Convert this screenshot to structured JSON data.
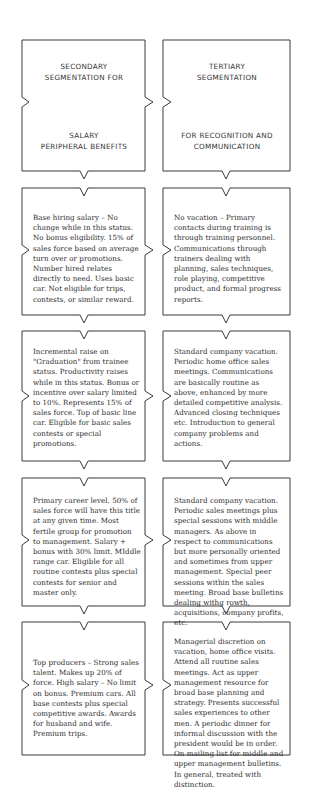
{
  "diagram": {
    "columns": [
      {
        "header": {
          "line1": "SECONDARY",
          "line2": "SEGMENTATION FOR",
          "line3": "SALARY",
          "line4": "PERIPHERAL BENEFITS"
        },
        "boxes": [
          "Base hiring salary – No change while in this status. No bonus eligibility. 15% of sales force based on average turn over or promotions. Number hired relates directly to need. Uses basic car. Not eligible for trips, contests, or similar reward.",
          "Incremental raise on \"Graduation\" from trainee status. Productivity raises while in this status. Bonus or incentive over salary limited to 10%. Represents 15% of sales force. Top of basic line car. Eligible for basic sales contests or special promotions.",
          "Primary career level. 50% of sales force will have this title at any given time. Most fertile group for promotion to management. Salary + bonus with 30% limit. MIddle range car. Eligible for all routine contests plus special contests for senior and master only.",
          "Top producers – Strong sales talent. Makes up 20% of force. High salary – No limit on bonus. Premium cars. All base contests plus special competitive awards. Awards for husband and wife. Premium trips."
        ]
      },
      {
        "header": {
          "line1": "TERTIARY",
          "line2": "SEGMENTATION",
          "line3": "FOR RECOGNITION AND",
          "line4": "COMMUNICATION"
        },
        "boxes": [
          "No vacation – Primary contacts during training is through training personnel. Communications through trainers dealing with planning, sales techniques, role playing, competitive product, and formal progress reports.",
          "Standard company vacation. Periodic home office sales meetings. Communications are basically routine as above, enhanced by more detailed competitive analysis. Advanced closing techniques etc. Introduction to general company problems and actions.",
          "Standard company vacation. Periodic sales meetings plus special sessions with middle managers. As above in respect to communications but more personally oriented and sometimes from upper management. Special peer sessions within the sales meeting. Broad base bulletins dealing withg rowth, acquisitions, company profits, etc.",
          "Managerial discretion on vacation, home office visits. Attend all routine sales meetings. Act as upper management resource for broad base planning and strategy. Presents successful sales experiences to other men. A periodic dinner for informal discussion with the president would be in order. On mailing list for middle and upper management bulletins. In general, treated with distinction."
        ]
      }
    ],
    "colors": {
      "line": "#3a3a3a",
      "text": "#2b2b2b",
      "background": "#ffffff"
    }
  }
}
